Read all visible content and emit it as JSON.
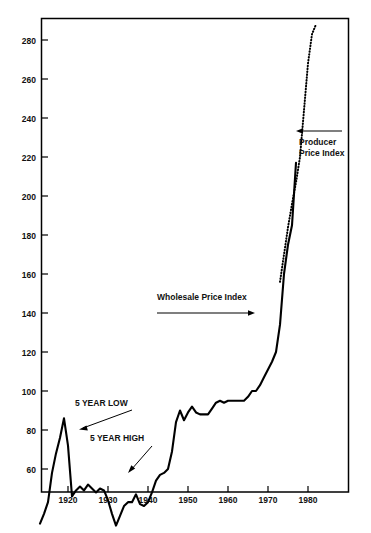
{
  "chart_data": {
    "type": "line",
    "title": "",
    "subtitle": "",
    "xlabel": "",
    "ylabel": "",
    "xlim": [
      1913,
      1984
    ],
    "ylim": [
      30,
      292
    ],
    "grid": false,
    "legend_position": "inline-annotation",
    "x_ticks": [
      "1920",
      "1930",
      "1940",
      "1950",
      "1960",
      "1970",
      "1980"
    ],
    "x_tick_values": [
      1920,
      1930,
      1940,
      1950,
      1960,
      1970,
      1980
    ],
    "y_ticks": [
      "40",
      "60",
      "80",
      "100",
      "120",
      "140",
      "160",
      "180",
      "200",
      "220",
      "240",
      "260",
      "280"
    ],
    "y_tick_values": [
      40,
      60,
      80,
      100,
      120,
      140,
      160,
      180,
      200,
      220,
      240,
      260,
      280
    ],
    "annotations": [
      {
        "text": "Producer Price Index",
        "arrow": "left"
      },
      {
        "text": "Wholesale Price Index",
        "arrow": "right"
      },
      {
        "text": "5 YEAR LOW",
        "arrow": "down-left"
      },
      {
        "text": "5 YEAR HIGH",
        "arrow": "down-left"
      }
    ],
    "series": [
      {
        "name": "Wholesale Price Index",
        "style": "solid",
        "x": [
          1913,
          1914,
          1915,
          1916,
          1917,
          1918,
          1919,
          1920,
          1921,
          1922,
          1923,
          1924,
          1925,
          1926,
          1927,
          1928,
          1929,
          1930,
          1931,
          1932,
          1933,
          1934,
          1935,
          1936,
          1937,
          1938,
          1939,
          1940,
          1941,
          1942,
          1943,
          1944,
          1945,
          1946,
          1947,
          1948,
          1949,
          1950,
          1951,
          1952,
          1953,
          1954,
          1955,
          1956,
          1957,
          1958,
          1959,
          1960,
          1961,
          1962,
          1963,
          1964,
          1965,
          1966,
          1967,
          1968,
          1969,
          1970,
          1971,
          1972,
          1973,
          1974,
          1975,
          1976,
          1977
        ],
        "values": [
          32,
          37,
          43,
          58,
          68,
          76,
          86,
          72,
          46,
          49,
          51,
          49,
          52,
          50,
          48,
          50,
          49,
          44,
          37,
          31,
          36,
          41,
          43,
          43,
          47,
          42,
          41,
          43,
          48,
          54,
          57,
          58,
          60,
          69,
          84,
          90,
          85,
          89,
          92,
          89,
          88,
          88,
          88,
          91,
          94,
          95,
          94,
          95,
          95,
          95,
          95,
          95,
          97,
          100,
          100,
          103,
          107,
          111,
          115,
          120,
          134,
          160,
          175,
          185,
          217
        ]
      },
      {
        "name": "Producer Price Index",
        "style": "dotted",
        "x": [
          1973,
          1974,
          1975,
          1976,
          1977,
          1978,
          1979,
          1980,
          1981,
          1982
        ],
        "values": [
          156,
          170,
          184,
          196,
          207,
          220,
          244,
          268,
          283,
          288
        ]
      }
    ]
  },
  "axis": {
    "y_labels": [
      "280",
      "260",
      "240",
      "220",
      "200",
      "180",
      "160",
      "140",
      "120",
      "100",
      "80",
      "60",
      "40"
    ],
    "x_labels": [
      "1920",
      "1930",
      "1940",
      "1950",
      "1960",
      "1970",
      "1980"
    ]
  },
  "labels": {
    "producer_price_index_line1": "Producer",
    "producer_price_index_line2": "Price Index",
    "wholesale_price_index": "Wholesale Price Index",
    "five_year_low": "5 YEAR LOW",
    "five_year_high": "5 YEAR HIGH"
  },
  "colors": {
    "line": "#000000",
    "background": "#ffffff",
    "text": "#111111"
  }
}
